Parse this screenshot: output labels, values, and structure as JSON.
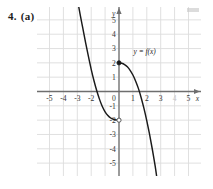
{
  "problem": {
    "number": "4.",
    "part": "(a)"
  },
  "chart_data": {
    "type": "line",
    "title": "",
    "xlabel": "x",
    "ylabel": "y",
    "xlim": [
      -5.9,
      5.9
    ],
    "ylim": [
      -5.9,
      5.9
    ],
    "grid": true,
    "grid_color": "#dcdcdc",
    "axis_color": "#6e6e6e",
    "curve_color": "#1a1a1a",
    "legend": "none",
    "annotations": [
      {
        "text": "y = f(x)",
        "x": 1.05,
        "y": 2.6
      }
    ],
    "xticks": [
      -5,
      -4,
      -3,
      -2,
      1,
      2,
      3,
      4,
      5
    ],
    "xtick_labels": [
      "-5",
      "-4",
      "-3",
      "-2",
      "1",
      "2",
      "3",
      "4",
      "5"
    ],
    "yticks": [
      5,
      4,
      3,
      2,
      1,
      -1,
      -2,
      -3,
      -4,
      -5
    ],
    "ytick_labels": [
      "5",
      "4",
      "3",
      "2",
      "1",
      "-1",
      "-2",
      "-3",
      "-4",
      "-5"
    ],
    "origin_label": "0",
    "faded_xtick": "4",
    "series": [
      {
        "name": "left-branch",
        "comment": "steep descending branch entering top of frame, flattening to an open endpoint at (0,-2)",
        "points": [
          [
            -2.95,
            6.2
          ],
          [
            -2.8,
            5.4
          ],
          [
            -2.6,
            4.4
          ],
          [
            -2.4,
            3.4
          ],
          [
            -2.2,
            2.45
          ],
          [
            -2.0,
            1.55
          ],
          [
            -1.8,
            0.75
          ],
          [
            -1.6,
            0.05
          ],
          [
            -1.4,
            -0.55
          ],
          [
            -1.2,
            -1.05
          ],
          [
            -1.0,
            -1.42
          ],
          [
            -0.8,
            -1.68
          ],
          [
            -0.6,
            -1.85
          ],
          [
            -0.4,
            -1.94
          ],
          [
            -0.2,
            -1.99
          ],
          [
            0,
            -2
          ]
        ],
        "endpoint_open": {
          "x": 0,
          "y": -2
        }
      },
      {
        "name": "right-branch",
        "comment": "starts at filled point (0,2), concave down, crosses x-axis near x=1.6, falls off the bottom of the frame",
        "points": [
          [
            0,
            2
          ],
          [
            0.2,
            1.97
          ],
          [
            0.4,
            1.88
          ],
          [
            0.6,
            1.72
          ],
          [
            0.8,
            1.48
          ],
          [
            1.0,
            1.15
          ],
          [
            1.2,
            0.72
          ],
          [
            1.4,
            0.2
          ],
          [
            1.6,
            -0.45
          ],
          [
            1.8,
            -1.2
          ],
          [
            2.0,
            -2.05
          ],
          [
            2.2,
            -3.0
          ],
          [
            2.4,
            -4.05
          ],
          [
            2.6,
            -5.2
          ],
          [
            2.75,
            -6.2
          ]
        ],
        "endpoint_closed": {
          "x": 0,
          "y": 2
        }
      }
    ]
  }
}
